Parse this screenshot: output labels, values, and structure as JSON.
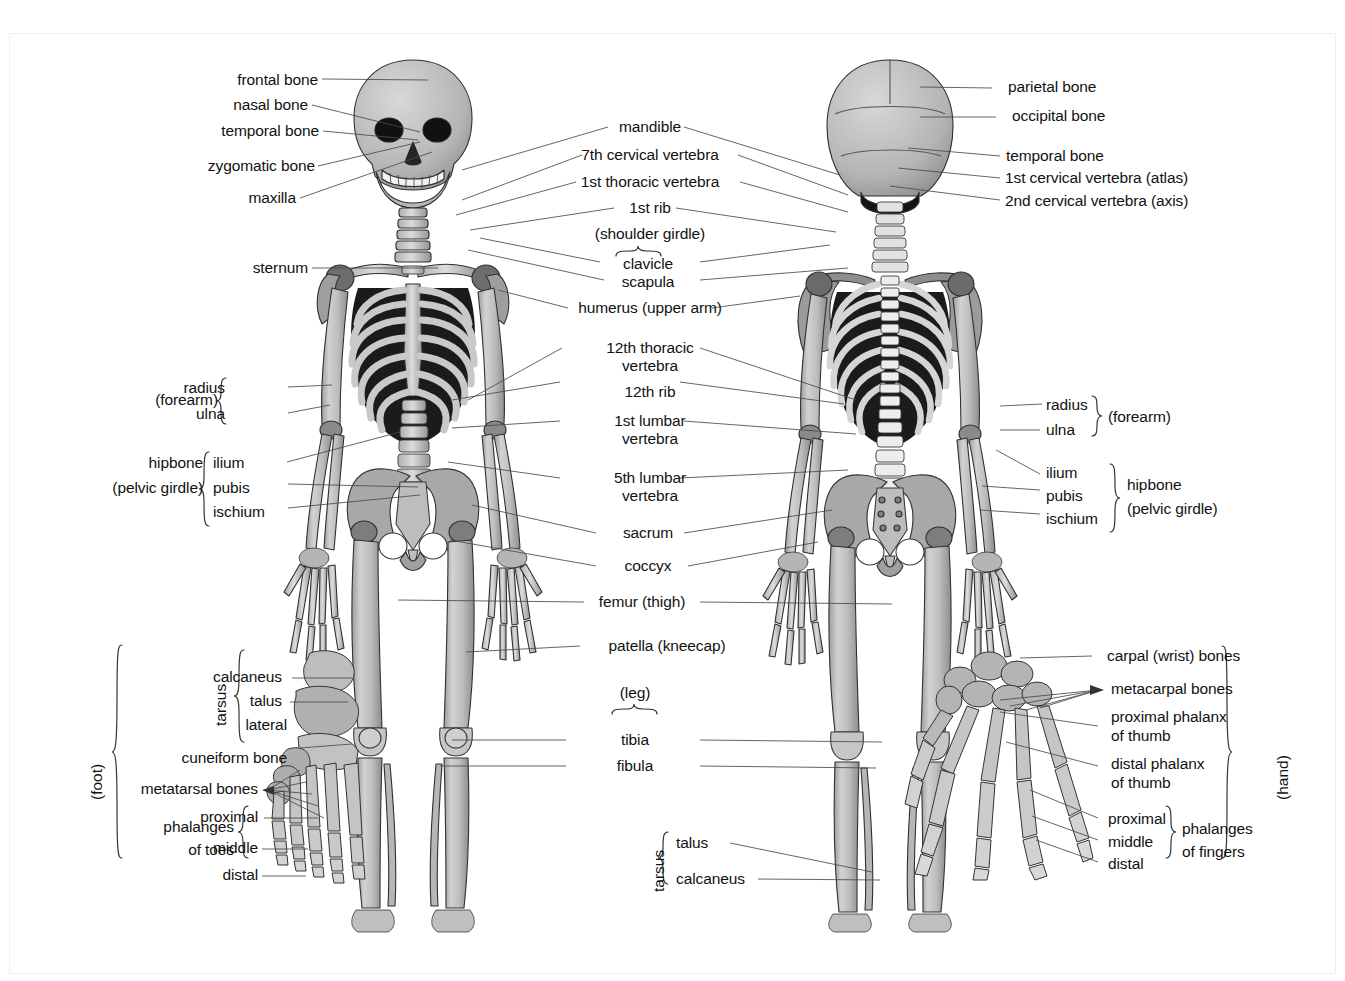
{
  "figure": {
    "title_fragment": "",
    "type": "anatomical-diagram",
    "views": [
      "anterior (front)",
      "posterior (back)"
    ],
    "insets": [
      "foot",
      "hand"
    ]
  },
  "labels": {
    "front_left": [
      {
        "id": "frontal-bone",
        "text": "frontal bone"
      },
      {
        "id": "nasal-bone",
        "text": "nasal bone"
      },
      {
        "id": "temporal-bone",
        "text": "temporal bone"
      },
      {
        "id": "zygomatic-bone",
        "text": "zygomatic bone"
      },
      {
        "id": "maxilla",
        "text": "maxilla"
      },
      {
        "id": "sternum",
        "text": "sternum"
      },
      {
        "id": "radius-left",
        "text": "radius"
      },
      {
        "id": "ulna-left",
        "text": "ulna"
      },
      {
        "id": "forearm-left",
        "text": "(forearm)"
      },
      {
        "id": "hipbone-left",
        "text": "hipbone"
      },
      {
        "id": "pelvic-girdle-left",
        "text": "(pelvic girdle)"
      },
      {
        "id": "ilium-left",
        "text": "ilium"
      },
      {
        "id": "pubis-left",
        "text": "pubis"
      },
      {
        "id": "ischium-left",
        "text": "ischium"
      }
    ],
    "center": [
      {
        "id": "mandible",
        "text": "mandible"
      },
      {
        "id": "cervical-7",
        "text": "7th cervical vertebra"
      },
      {
        "id": "thoracic-1",
        "text": "1st thoracic vertebra"
      },
      {
        "id": "rib-1",
        "text": "1st rib"
      },
      {
        "id": "shoulder-girdle",
        "text": "(shoulder girdle)"
      },
      {
        "id": "clavicle",
        "text": "clavicle"
      },
      {
        "id": "scapula",
        "text": "scapula"
      },
      {
        "id": "humerus",
        "text": "humerus (upper arm)"
      },
      {
        "id": "thoracic-12",
        "text": "12th thoracic"
      },
      {
        "id": "thoracic-12-b",
        "text": "vertebra"
      },
      {
        "id": "rib-12",
        "text": "12th rib"
      },
      {
        "id": "lumbar-1",
        "text": "1st lumbar"
      },
      {
        "id": "lumbar-1-b",
        "text": "vertebra"
      },
      {
        "id": "lumbar-5",
        "text": "5th lumbar"
      },
      {
        "id": "lumbar-5-b",
        "text": "vertebra"
      },
      {
        "id": "sacrum",
        "text": "sacrum"
      },
      {
        "id": "coccyx",
        "text": "coccyx"
      },
      {
        "id": "femur",
        "text": "femur (thigh)"
      },
      {
        "id": "patella",
        "text": "patella (kneecap)"
      },
      {
        "id": "leg",
        "text": "(leg)"
      },
      {
        "id": "tibia",
        "text": "tibia"
      },
      {
        "id": "fibula",
        "text": "fibula"
      },
      {
        "id": "tarsus-center",
        "text": "tarsus"
      },
      {
        "id": "talus-center",
        "text": "talus"
      },
      {
        "id": "calcaneus-center",
        "text": "calcaneus"
      }
    ],
    "back_right": [
      {
        "id": "parietal-bone",
        "text": "parietal bone"
      },
      {
        "id": "occipital-bone",
        "text": "occipital bone"
      },
      {
        "id": "temporal-bone-r",
        "text": "temporal bone"
      },
      {
        "id": "cervical-1",
        "text": "1st cervical vertebra (atlas)"
      },
      {
        "id": "cervical-2",
        "text": "2nd cervical vertebra (axis)"
      },
      {
        "id": "radius-right",
        "text": "radius"
      },
      {
        "id": "ulna-right",
        "text": "ulna"
      },
      {
        "id": "forearm-right",
        "text": "(forearm)"
      },
      {
        "id": "ilium-right",
        "text": "ilium"
      },
      {
        "id": "pubis-right",
        "text": "pubis"
      },
      {
        "id": "ischium-right",
        "text": "ischium"
      },
      {
        "id": "hipbone-right",
        "text": "hipbone"
      },
      {
        "id": "pelvic-girdle-right",
        "text": "(pelvic girdle)"
      }
    ],
    "foot_inset": [
      {
        "id": "foot-bracket",
        "text": "(foot)"
      },
      {
        "id": "tarsus-foot",
        "text": "tarsus"
      },
      {
        "id": "calcaneus-foot",
        "text": "calcaneus"
      },
      {
        "id": "talus-foot",
        "text": "talus"
      },
      {
        "id": "lateral",
        "text": "lateral"
      },
      {
        "id": "cuneiform-bone",
        "text": "cuneiform bone"
      },
      {
        "id": "metatarsal-bones",
        "text": "metatarsal bones"
      },
      {
        "id": "phalanges-of-toes",
        "text": "phalanges"
      },
      {
        "id": "phalanges-of-toes-b",
        "text": "of toes"
      },
      {
        "id": "proximal-toe",
        "text": "proximal"
      },
      {
        "id": "middle-toe",
        "text": "middle"
      },
      {
        "id": "distal-toe",
        "text": "distal"
      }
    ],
    "hand_inset": [
      {
        "id": "hand-bracket",
        "text": "(hand)"
      },
      {
        "id": "carpal-bones",
        "text": "carpal (wrist) bones"
      },
      {
        "id": "metacarpal-bones",
        "text": "metacarpal bones"
      },
      {
        "id": "proximal-phalanx-thumb",
        "text": "proximal phalanx"
      },
      {
        "id": "proximal-phalanx-thumb-b",
        "text": "of thumb"
      },
      {
        "id": "distal-phalanx-thumb",
        "text": "distal phalanx"
      },
      {
        "id": "distal-phalanx-thumb-b",
        "text": "of thumb"
      },
      {
        "id": "proximal-finger",
        "text": "proximal"
      },
      {
        "id": "middle-finger",
        "text": "middle"
      },
      {
        "id": "distal-finger",
        "text": "distal"
      },
      {
        "id": "phalanges-of-fingers",
        "text": "phalanges"
      },
      {
        "id": "phalanges-of-fingers-b",
        "text": "of fingers"
      }
    ]
  },
  "colors": {
    "background": "#ffffff",
    "text": "#121212",
    "leader_line": "#4a4a4a",
    "bone_light": "#d9d9d9",
    "bone_mid": "#b9b9b9",
    "bone_dark": "#8f8f8f",
    "bone_shadow": "#6e6e6e",
    "cavity_dark": "#1d1d1d",
    "outline": "#2b2b2b"
  }
}
